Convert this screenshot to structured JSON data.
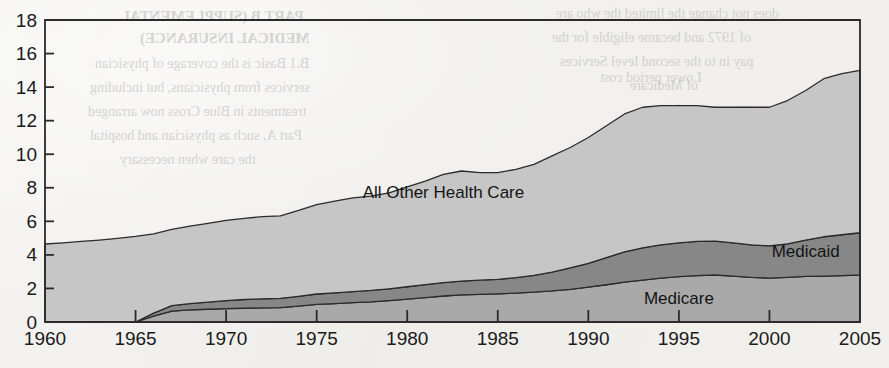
{
  "page": {
    "background_color": "#f1f0ed",
    "ghost_text": [
      {
        "text": "PART B (SUPPLEMENTAL",
        "x": 120,
        "y": 8,
        "size": 15,
        "bold": true
      },
      {
        "text": "MEDICAL INSURANCE)",
        "x": 140,
        "y": 30,
        "size": 15,
        "bold": true
      },
      {
        "text": "B.1 Basic is the coverage of physician",
        "x": 95,
        "y": 56,
        "size": 14,
        "bold": false
      },
      {
        "text": "services from physicians, but including",
        "x": 90,
        "y": 80,
        "size": 14,
        "bold": false
      },
      {
        "text": "treatments in Blue Cross now arranged",
        "x": 88,
        "y": 104,
        "size": 14,
        "bold": false
      },
      {
        "text": "Part A, such as physician and hospital",
        "x": 90,
        "y": 128,
        "size": 14,
        "bold": false
      },
      {
        "text": "the care when necessary",
        "x": 120,
        "y": 152,
        "size": 14,
        "bold": false
      },
      {
        "text": "does not change the limited the who are",
        "x": 556,
        "y": 6,
        "size": 14,
        "bold": false
      },
      {
        "text": "of 1972 and became eligible for the",
        "x": 552,
        "y": 30,
        "size": 14,
        "bold": false
      },
      {
        "text": "pay in to the second level Services",
        "x": 560,
        "y": 54,
        "size": 14,
        "bold": false
      },
      {
        "text": "of Medicare",
        "x": 630,
        "y": 78,
        "size": 14,
        "bold": false
      },
      {
        "text": "voluntary",
        "x": 640,
        "y": 102,
        "size": 14,
        "bold": false
      },
      {
        "text": "Lower period cost",
        "x": 600,
        "y": 70,
        "size": 14,
        "bold": false
      }
    ]
  },
  "chart_data": {
    "type": "area",
    "stacked": true,
    "title": "",
    "subtitle": "",
    "xlabel": "",
    "ylabel": "",
    "xlim": [
      1960,
      2005
    ],
    "ylim": [
      0,
      18
    ],
    "ytick_values": [
      0,
      2,
      4,
      6,
      8,
      10,
      12,
      14,
      16,
      18
    ],
    "ytick_labels": [
      "0",
      "2",
      "4",
      "6",
      "8",
      "10",
      "12",
      "14",
      "16",
      "18"
    ],
    "xtick_values": [
      1960,
      1965,
      1970,
      1975,
      1980,
      1985,
      1990,
      1995,
      2000,
      2005
    ],
    "xtick_labels": [
      "1960",
      "1965",
      "1970",
      "1975",
      "1980",
      "1985",
      "1990",
      "1995",
      "2000",
      "2005"
    ],
    "grid": false,
    "legend_position": "inline-annotations",
    "x": [
      1960,
      1961,
      1962,
      1963,
      1964,
      1965,
      1966,
      1967,
      1968,
      1969,
      1970,
      1971,
      1972,
      1973,
      1974,
      1975,
      1976,
      1977,
      1978,
      1979,
      1980,
      1981,
      1982,
      1983,
      1984,
      1985,
      1986,
      1987,
      1988,
      1989,
      1990,
      1991,
      1992,
      1993,
      1994,
      1995,
      1996,
      1997,
      1998,
      1999,
      2000,
      2001,
      2002,
      2003,
      2004,
      2005
    ],
    "series": [
      {
        "name": "Medicare",
        "color": "#a9a9a9",
        "label_color": "#141414",
        "label_x": 1995,
        "label_y": 1.05,
        "values": [
          0,
          0,
          0,
          0,
          0,
          0,
          0.35,
          0.65,
          0.72,
          0.76,
          0.8,
          0.82,
          0.84,
          0.86,
          0.95,
          1.05,
          1.1,
          1.15,
          1.2,
          1.28,
          1.36,
          1.45,
          1.55,
          1.62,
          1.65,
          1.68,
          1.72,
          1.78,
          1.85,
          1.95,
          2.08,
          2.22,
          2.38,
          2.5,
          2.62,
          2.7,
          2.76,
          2.8,
          2.74,
          2.66,
          2.62,
          2.66,
          2.72,
          2.74,
          2.76,
          2.8
        ]
      },
      {
        "name": "Medicaid",
        "color": "#878787",
        "label_color": "#f4f4f4",
        "label_x": 2002,
        "label_y": 3.9,
        "values": [
          0,
          0,
          0,
          0,
          0,
          0,
          0.18,
          0.32,
          0.38,
          0.42,
          0.48,
          0.52,
          0.54,
          0.55,
          0.58,
          0.62,
          0.64,
          0.66,
          0.68,
          0.7,
          0.74,
          0.78,
          0.8,
          0.82,
          0.84,
          0.86,
          0.92,
          1.0,
          1.12,
          1.28,
          1.42,
          1.62,
          1.8,
          1.92,
          1.98,
          2.02,
          2.04,
          2.02,
          1.98,
          1.94,
          1.92,
          2.0,
          2.16,
          2.34,
          2.44,
          2.52
        ]
      },
      {
        "name": "All Other Health Care",
        "color": "#c6c6c6",
        "label_color": "#141414",
        "label_x": 1982,
        "label_y": 7.4,
        "values": [
          4.65,
          4.72,
          4.8,
          4.88,
          4.98,
          5.1,
          4.72,
          4.55,
          4.62,
          4.7,
          4.78,
          4.84,
          4.9,
          4.92,
          5.12,
          5.33,
          5.46,
          5.59,
          5.62,
          5.72,
          5.95,
          6.17,
          6.45,
          6.56,
          6.41,
          6.36,
          6.46,
          6.62,
          6.93,
          7.17,
          7.5,
          7.86,
          8.22,
          8.38,
          8.3,
          8.18,
          8.1,
          7.98,
          8.08,
          8.2,
          8.26,
          8.54,
          8.92,
          9.42,
          9.6,
          9.68
        ]
      }
    ],
    "stack_totals": [
      4.65,
      4.72,
      4.8,
      4.88,
      4.98,
      5.1,
      5.25,
      5.52,
      5.72,
      5.88,
      6.06,
      6.18,
      6.28,
      6.33,
      6.65,
      7.0,
      7.2,
      7.4,
      7.5,
      7.7,
      8.05,
      8.4,
      8.8,
      9.0,
      8.9,
      8.9,
      9.1,
      9.4,
      9.9,
      10.4,
      11.0,
      11.7,
      12.4,
      12.8,
      12.9,
      12.9,
      12.9,
      12.8,
      12.8,
      12.8,
      12.8,
      13.2,
      13.8,
      14.5,
      14.8,
      15.0
    ],
    "annotations": [
      {
        "text": "All Other Health Care",
        "x": 1982,
        "y": 7.4,
        "color": "#141414"
      },
      {
        "text": "Medicare",
        "x": 1995,
        "y": 1.05,
        "color": "#141414"
      },
      {
        "text": "Medicaid",
        "x": 2002,
        "y": 3.9,
        "color": "#f4f4f4"
      }
    ]
  }
}
